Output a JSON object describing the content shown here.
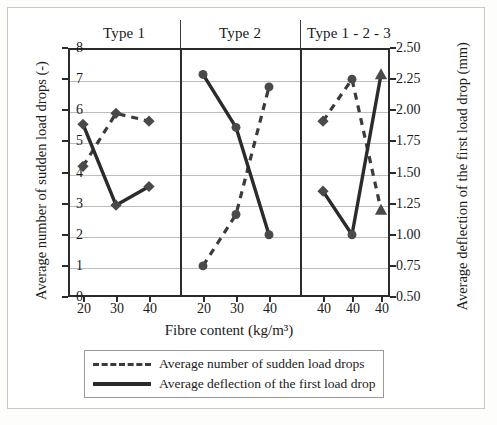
{
  "chart_data": {
    "type": "line",
    "title": "",
    "xlabel": "Fibre content (kg/m³)",
    "ylabel_left": "Average number of sudden load drops (-)",
    "ylabel_right": "Average deflection of the first load drop (mm)",
    "grid": true,
    "legend_position": "bottom",
    "panels": [
      {
        "header": "Type 1",
        "categories": [
          "20",
          "30",
          "40"
        ],
        "marker": "diamond",
        "series": [
          {
            "name": "Average number of sudden load drops",
            "axis": "left",
            "style": "dashed",
            "values": [
              4.2,
              5.9,
              5.65
            ]
          },
          {
            "name": "Average deflection of the first load drop",
            "axis": "right",
            "style": "solid",
            "values": [
              1.89,
              1.24,
              1.39
            ],
            "left_axis_equivalent": [
              5.55,
              2.95,
              3.55
            ]
          }
        ]
      },
      {
        "header": "Type 2",
        "categories": [
          "20",
          "30",
          "40"
        ],
        "marker": "circle",
        "series": [
          {
            "name": "Average number of sudden load drops",
            "axis": "left",
            "style": "dashed",
            "values": [
              1.0,
              2.65,
              6.75
            ]
          },
          {
            "name": "Average deflection of the first load drop",
            "axis": "right",
            "style": "solid",
            "values": [
              2.29,
              1.86,
              1.0
            ],
            "left_axis_equivalent": [
              7.15,
              5.45,
              2.0
            ]
          }
        ]
      },
      {
        "header": "Type 1 - 2 - 3",
        "categories": [
          "40",
          "40",
          "40"
        ],
        "marker": "mixed",
        "point_markers": [
          "diamond",
          "circle",
          "triangle"
        ],
        "series": [
          {
            "name": "Average number of sudden load drops",
            "axis": "left",
            "style": "dashed",
            "values": [
              5.65,
              7.0,
              2.8
            ]
          },
          {
            "name": "Average deflection of the first load drop",
            "axis": "right",
            "style": "solid",
            "values": [
              1.35,
              1.0,
              2.29
            ],
            "left_axis_equivalent": [
              3.4,
              2.0,
              7.15
            ]
          }
        ]
      }
    ],
    "yaxis_left": {
      "min": 0,
      "max": 8,
      "step": 1,
      "ticks": [
        "0",
        "1",
        "2",
        "3",
        "4",
        "5",
        "6",
        "7",
        "8"
      ]
    },
    "yaxis_right": {
      "min": 0.5,
      "max": 2.5,
      "step": 0.25,
      "ticks": [
        "0.50",
        "0.75",
        "1.00",
        "1.25",
        "1.50",
        "1.75",
        "2.00",
        "2.25",
        "2.50"
      ]
    },
    "legend": [
      {
        "label": "Average number of sudden load drops",
        "style": "dashed"
      },
      {
        "label": "Average deflection of the first load drop",
        "style": "solid"
      }
    ],
    "colors": {
      "line": "#2b2b2b",
      "dashed": "#3b3b3b",
      "marker": "#4a4a4a",
      "grid": "#bdbdbd",
      "axis": "#2b2b2b"
    }
  }
}
